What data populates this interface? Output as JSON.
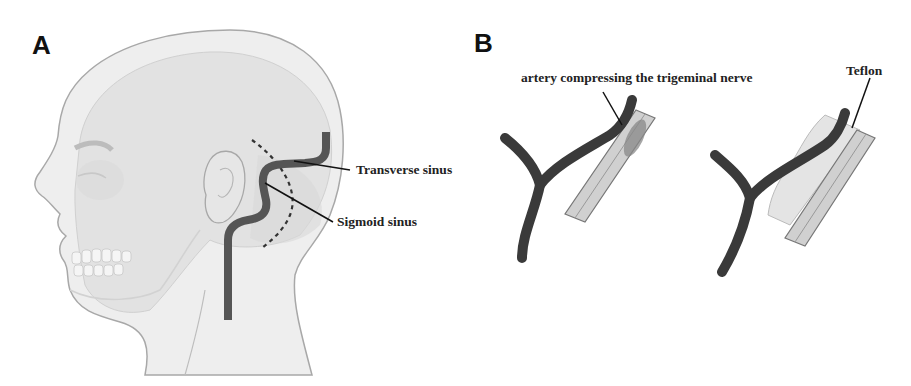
{
  "panels": [
    {
      "letter": "A",
      "description": "Lateral view of head showing venous sinuses",
      "labels": {
        "transverse": "Transverse sinus",
        "sigmoid": "Sigmoid sinus"
      }
    },
    {
      "letter": "B",
      "description": "Microvascular decompression of trigeminal nerve",
      "labels": {
        "artery": "artery compressing the trigeminal nerve",
        "teflon": "Teflon"
      }
    }
  ],
  "colors": {
    "sinus": "#555555",
    "artery": "#3a3a3a",
    "nerve": "#cfcfcf",
    "head_fill": "#ececec",
    "head_outline": "#a8a8a8",
    "teflon": "#e4e4e4"
  }
}
